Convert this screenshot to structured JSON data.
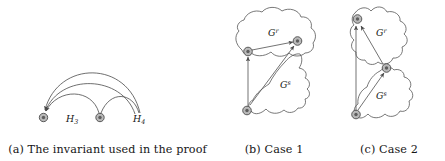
{
  "figure": {
    "background_color": "#ffffff",
    "ink_color": "#1a1a1a",
    "stroke_color": "#4a4a4a",
    "node_fill_color": "#b9b9b9"
  },
  "panels": [
    {
      "id": "a",
      "caption": "(a) The invariant used in the proof",
      "caption_prefix": "(a)",
      "caption_text": "The invariant used in the proof",
      "type": "arc-diagram",
      "node_labels": [
        "H₃",
        "H₄"
      ],
      "labels": [
        {
          "text": "H",
          "sub": "3",
          "name": "label-h3"
        },
        {
          "text": "H",
          "sub": "4",
          "name": "label-h4"
        }
      ],
      "node_count": 3,
      "arc_count": 4
    },
    {
      "id": "b",
      "caption": "(b) Case 1",
      "caption_prefix": "(b)",
      "caption_text": "Case 1",
      "type": "region-graph",
      "regions": [
        {
          "text": "G",
          "sup": "r",
          "name": "region-label-gr"
        },
        {
          "text": "G",
          "sup": "s",
          "name": "region-label-gs"
        }
      ],
      "node_count": 3,
      "edge_count": 3
    },
    {
      "id": "c",
      "caption": "(c) Case 2",
      "caption_prefix": "(c)",
      "caption_text": "Case 2",
      "type": "region-graph",
      "regions": [
        {
          "text": "G",
          "sup": "r",
          "name": "region-label-gr"
        },
        {
          "text": "G",
          "sup": "s",
          "name": "region-label-gs"
        }
      ],
      "node_count": 3,
      "edge_count": 3
    }
  ]
}
